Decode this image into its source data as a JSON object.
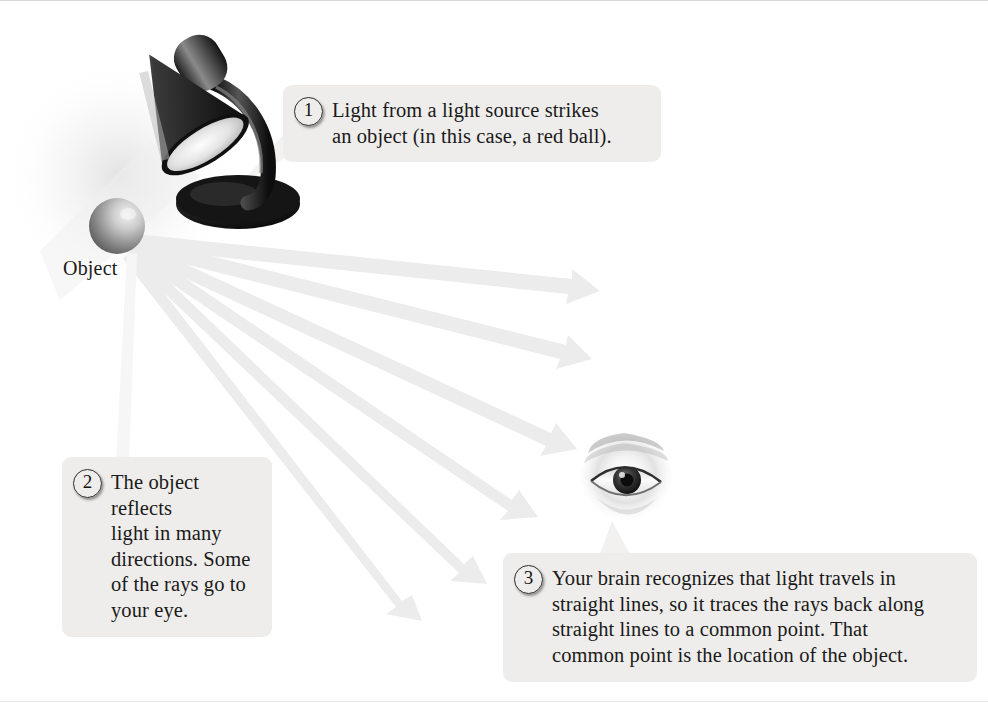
{
  "figure": {
    "background_color": "#ffffff",
    "callout_bg_color": "#eeedeb",
    "text_color": "#1a1a1a",
    "ray_color": "#ececec"
  },
  "labels": {
    "object": "Object"
  },
  "callouts": [
    {
      "number": "1",
      "text": "Light from a light source strikes\nan object (in this case, a red ball)."
    },
    {
      "number": "2",
      "text": "The object reflects\nlight in many\ndirections. Some\nof the rays go to\nyour eye."
    },
    {
      "number": "3",
      "text": "Your brain recognizes that light travels in\nstraight lines, so it traces the rays back along\nstraight lines to a common point. That\ncommon point is the location of the object."
    }
  ],
  "objects": [
    {
      "name": "desk-lamp",
      "description": "dark desk lamp with conical shade aimed down-left"
    },
    {
      "name": "red-ball",
      "description": "sphere lit from upper right, shown in grayscale"
    },
    {
      "name": "human-eye",
      "description": "eye viewing the reflected light rays"
    }
  ],
  "rays": {
    "origin": {
      "x": 135,
      "y": 240
    },
    "count": 7,
    "tips": [
      {
        "x": 598,
        "y": 290
      },
      {
        "x": 590,
        "y": 356
      },
      {
        "x": 575,
        "y": 445
      },
      {
        "x": 535,
        "y": 512
      },
      {
        "x": 485,
        "y": 578
      },
      {
        "x": 420,
        "y": 615
      },
      {
        "x": 128,
        "y": 470
      }
    ]
  }
}
